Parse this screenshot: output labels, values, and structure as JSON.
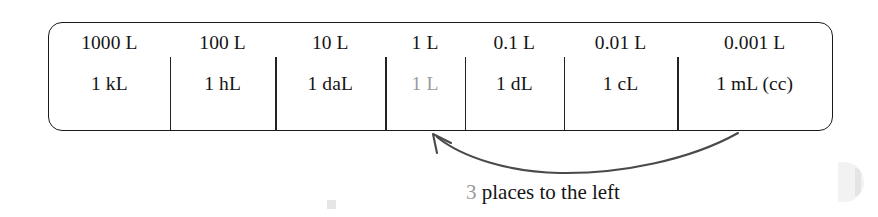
{
  "figure": {
    "type": "metric-volume-conversion-chart",
    "columns": [
      {
        "value_label": "1000 L",
        "unit_label": "1 kL",
        "unit_dim": false,
        "highlighted": false
      },
      {
        "value_label": "100 L",
        "unit_label": "1 hL",
        "unit_dim": false,
        "highlighted": false
      },
      {
        "value_label": "10 L",
        "unit_label": "1 daL",
        "unit_dim": false,
        "highlighted": false
      },
      {
        "value_label": "1 L",
        "unit_label": "1 L",
        "unit_dim": true,
        "highlighted": true
      },
      {
        "value_label": "0.1 L",
        "unit_label": "1 dL",
        "unit_dim": false,
        "highlighted": false
      },
      {
        "value_label": "0.01 L",
        "unit_label": "1 cL",
        "unit_dim": false,
        "highlighted": false
      },
      {
        "value_label": "0.001 L",
        "unit_label": "1 mL (cc)",
        "unit_dim": false,
        "highlighted": false
      }
    ],
    "annotation": {
      "count": "3",
      "text": " places to the left",
      "full_text": "3 places to the left",
      "arrow_direction": "right-to-left",
      "arrow_from_column": "0.001 L",
      "arrow_to_column": "1 L"
    },
    "colors": {
      "ink": "#141414",
      "dim_ink": "#9a9a9a",
      "border": "#1a1a1a",
      "background": "#ffffff",
      "arrow": "#4a4a4a"
    }
  }
}
